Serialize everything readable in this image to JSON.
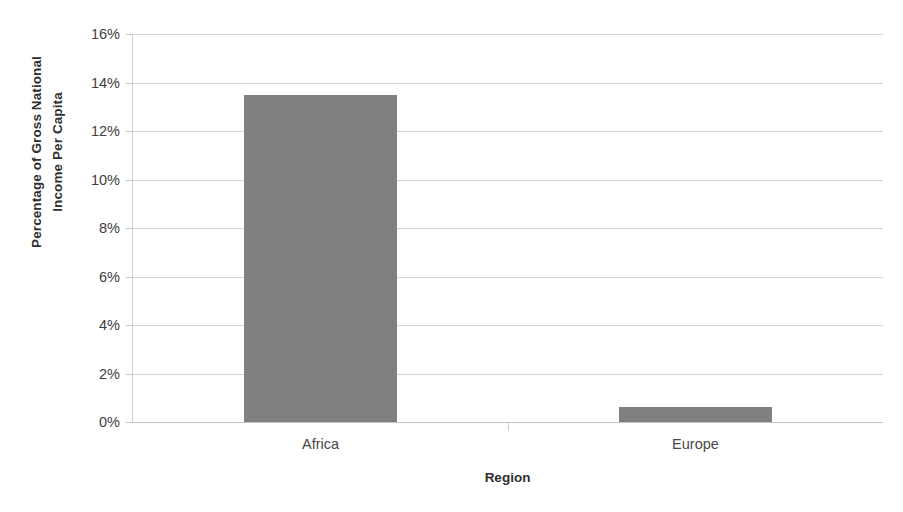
{
  "chart_data": {
    "type": "bar",
    "title": "",
    "subtitle": "",
    "categories": [
      "Africa",
      "Europe"
    ],
    "values": [
      13.5,
      0.6
    ],
    "value_unit": "%",
    "series": [
      {
        "name": "Percentage of Gross National Income Per Capita",
        "values": [
          13.5,
          0.6
        ]
      }
    ],
    "xlabel": "Region",
    "ylabel_lines": [
      "Percentage of Gross National",
      "Income Per Capita"
    ],
    "ylabel": "Percentage of Gross National Income Per Capita",
    "ylim": [
      0,
      16
    ],
    "ytick_step": 2,
    "ytick_labels": [
      "16%",
      "14%",
      "12%",
      "10%",
      "8%",
      "6%",
      "4%",
      "2%",
      "0%"
    ],
    "ytick_values": [
      16,
      14,
      12,
      10,
      8,
      6,
      4,
      2,
      0
    ],
    "grid": "horizontal",
    "legend": "none",
    "bar_color": "#808080",
    "gridline_color": "#d4d4d4",
    "axis_color": "#cfcfcf",
    "background_color": "#ffffff",
    "text_color": "#3b3b3b"
  }
}
